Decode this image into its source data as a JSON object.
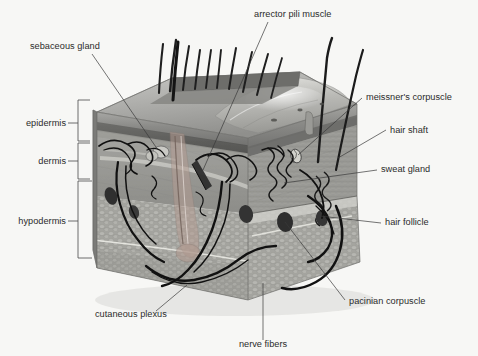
{
  "figure": {
    "background_color": "#f7f7f5",
    "text_color": "#2b2b2b",
    "leader_color": "#3a3a3a"
  },
  "layer_labels": [
    {
      "id": "epidermis",
      "label": "epidermis",
      "text_x": 58,
      "text_y": 123,
      "bracket_top": 100,
      "bracket_bottom": 141,
      "bracket_x": 84,
      "tick_y": 123
    },
    {
      "id": "dermis",
      "label": "dermis",
      "text_x": 58,
      "text_y": 161,
      "bracket_top": 143,
      "bracket_bottom": 179,
      "bracket_x": 84,
      "tick_y": 161
    },
    {
      "id": "hypodermis",
      "label": "hypodermis",
      "text_x": 58,
      "text_y": 221,
      "bracket_top": 181,
      "bracket_bottom": 258,
      "bracket_x": 84,
      "tick_y": 221
    }
  ],
  "callouts": [
    {
      "id": "sebaceous-gland",
      "label": "sebaceous gland",
      "text_x": 30,
      "text_y": 49,
      "anchor": "start",
      "leader": "M 92 54 L 158 150"
    },
    {
      "id": "arrector-pili-muscle",
      "label": "arrector pili muscle",
      "text_x": 254,
      "text_y": 17,
      "anchor": "start",
      "leader": "M 268 22 L 203 170"
    },
    {
      "id": "meissners-corpuscle",
      "label": "meissner's corpuscle",
      "text_x": 366,
      "text_y": 100,
      "anchor": "start",
      "leader": "M 362 98 L 298 155"
    },
    {
      "id": "hair-shaft",
      "label": "hair shaft",
      "text_x": 390,
      "text_y": 133,
      "anchor": "start",
      "leader": "M 386 130 L 338 158"
    },
    {
      "id": "sweat-gland",
      "label": "sweat gland",
      "text_x": 381,
      "text_y": 172,
      "anchor": "start",
      "leader": "M 377 170 L 284 183"
    },
    {
      "id": "hair-follicle",
      "label": "hair follicle",
      "text_x": 385,
      "text_y": 225,
      "anchor": "start",
      "leader": "M 381 223 L 320 216"
    },
    {
      "id": "pacinian-corpuscle",
      "label": "pacinian corpuscle",
      "text_x": 349,
      "text_y": 304,
      "anchor": "start",
      "leader": "M 345 300 L 285 222"
    },
    {
      "id": "cutaneous-plexus",
      "label": "cutaneous plexus",
      "text_x": 95,
      "text_y": 317,
      "anchor": "start",
      "leader": "M 156 311 L 187 285"
    },
    {
      "id": "nerve-fibers",
      "label": "nerve fibers",
      "text_x": 240,
      "text_y": 347,
      "anchor": "middle",
      "leader": "M 263 340 L 263 283"
    }
  ],
  "illustration": {
    "block_top_face": "skin surface with hair shafts",
    "short_hairs_count": 9,
    "long_hairs_count": 2,
    "tones": {
      "epidermis_band": "#8d8d8d",
      "epidermis_dark_band": "#5d5d5d",
      "dermis_face": "#9a9a9a",
      "hypodermis_face": "#a8a8a3",
      "side_face": "#8a8a88",
      "top_face": "#b3b3b0",
      "vessel": "#1c1c1c"
    }
  }
}
